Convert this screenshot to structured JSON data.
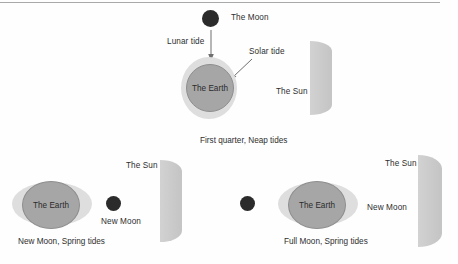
{
  "diagram": {
    "colors": {
      "moon": "#2b2b2b",
      "earth": "#a6a6a6",
      "earth_stroke": "#8e8e8e",
      "tide_envelope": "#dedede",
      "sun": "#c9c9c9",
      "text": "#2e2e2e",
      "rule": "#a9a9a9",
      "background": "#fefefe"
    },
    "panels": [
      {
        "id": "first-quarter",
        "caption": "First quarter, Neap tides",
        "moon_label": "The Moon",
        "earth_label": "The Earth",
        "sun_label": "The Sun",
        "annotations": [
          {
            "id": "lunar-tide",
            "label": "Lunar tide"
          },
          {
            "id": "solar-tide",
            "label": "Solar tide"
          }
        ]
      },
      {
        "id": "new-moon",
        "caption": "New Moon, Spring tides",
        "moon_label": "New Moon",
        "earth_label": "The Earth",
        "sun_label": "The Sun"
      },
      {
        "id": "full-moon",
        "caption": "Full Moon, Spring tides",
        "moon_label": "New Moon",
        "earth_label": "The Earth",
        "sun_label": "The Sun"
      }
    ]
  }
}
